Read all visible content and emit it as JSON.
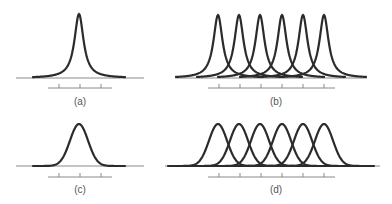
{
  "figure": {
    "colors": {
      "curve": "#2b2b2b",
      "axis": "#8a8a8a",
      "label": "#555555"
    },
    "panels": [
      {
        "id": "a",
        "label": "(a)",
        "shape": "lorentzian",
        "baseline_y": 78,
        "baseline_x": [
          16,
          144
        ],
        "peak_height": 64,
        "hwhm": 5.5,
        "extent": 46,
        "peaks": [
          79
        ],
        "ruler": {
          "y": 88,
          "x": [
            48,
            112
          ],
          "ticks": [
            59,
            80,
            101
          ]
        },
        "label_pos": [
          80,
          105
        ]
      },
      {
        "id": "b",
        "label": "(b)",
        "shape": "lorentzian",
        "baseline_y": 78,
        "baseline_x": [
          175,
          367
        ],
        "peak_height": 63,
        "hwhm": 5.5,
        "extent": 42,
        "peaks": [
          218,
          239,
          260,
          282,
          303,
          324
        ],
        "ruler": {
          "y": 88,
          "x": [
            208,
            335
          ],
          "ticks": [
            219,
            240,
            261,
            282,
            303,
            324
          ]
        },
        "label_pos": [
          276,
          105
        ]
      },
      {
        "id": "c",
        "label": "(c)",
        "shape": "gaussian",
        "baseline_y": 166,
        "baseline_x": [
          16,
          144
        ],
        "peak_height": 42,
        "sigma": 9,
        "extent": 46,
        "peaks": [
          79
        ],
        "ruler": {
          "y": 177,
          "x": [
            48,
            112
          ],
          "ticks": [
            59,
            80,
            101
          ]
        },
        "label_pos": [
          80,
          193
        ]
      },
      {
        "id": "d",
        "label": "(d)",
        "shape": "gaussian",
        "baseline_y": 166,
        "baseline_x": [
          165,
          380
        ],
        "peak_height": 42,
        "sigma": 9,
        "extent": 50,
        "peaks": [
          218,
          239,
          260,
          282,
          303,
          324
        ],
        "ruler": {
          "y": 177,
          "x": [
            208,
            335
          ],
          "ticks": [
            219,
            240,
            261,
            282,
            303,
            324
          ]
        },
        "label_pos": [
          276,
          193
        ]
      }
    ]
  }
}
